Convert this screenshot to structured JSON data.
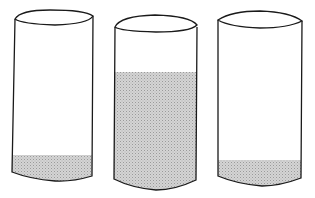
{
  "figure": {
    "colors": {
      "outline": "#1a1a1a",
      "liquid": "#c8c8c8",
      "background": "#ffffff"
    },
    "glasses": [
      {
        "label": "glass-1",
        "fill_level": "low"
      },
      {
        "label": "glass-2",
        "fill_level": "high"
      },
      {
        "label": "glass-3",
        "fill_level": "low"
      }
    ]
  }
}
